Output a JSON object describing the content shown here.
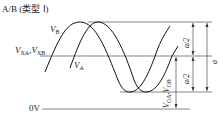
{
  "title": "A/B (类型 Ⅰ)",
  "labels": {
    "vb": "V",
    "vb_sub": "B",
    "va": "V",
    "va_sub": "A",
    "vxa_vxb": "V",
    "vxa_sub": "XA",
    "vxb_sep": ",V",
    "vxb_sub": "XB",
    "voa_vob": "V",
    "voa_sub": "OA",
    "vob_sep": ",V",
    "vob_sub": "OB",
    "zero": "0V",
    "half_a_top": "a/2",
    "half_a_bottom": "a/2",
    "full_a": "a"
  },
  "colors": {
    "line": "#222222",
    "background": "#ffffff"
  }
}
